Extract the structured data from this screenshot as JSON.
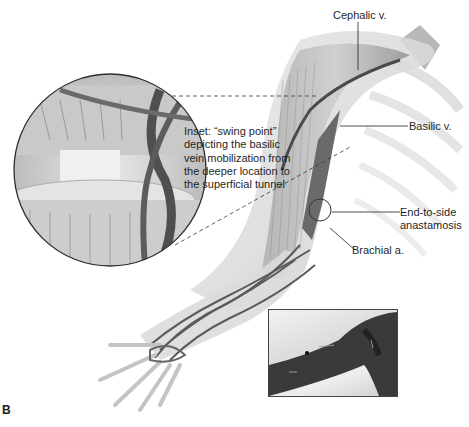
{
  "figure": {
    "panel_letter": "B",
    "labels": {
      "cephalic": "Cephalic v.",
      "basilic": "Basilic v.",
      "anastomosis_line1": "End-to-side",
      "anastomosis_line2": "anastamosis",
      "brachial": "Brachial a."
    },
    "inset_caption": [
      "Inset: “swing point”",
      "depicting the basilic",
      "vein mobilization from",
      "the deeper location to",
      "the superficial tunnel"
    ],
    "colors": {
      "background": "#ffffff",
      "vessel": "#555555",
      "muscle": "#a8a8a8",
      "skin": "#d9d9d9",
      "text": "#1f1f1f"
    }
  }
}
